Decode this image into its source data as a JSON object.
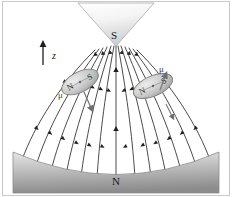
{
  "figure": {
    "name": "magnetic-dipoles-in-inhomogeneous-field",
    "width": 232,
    "height": 197,
    "background": "#ffffff",
    "border_color": "#b8b8b8"
  },
  "poles": {
    "top": {
      "label": "S",
      "shape": "inverted-triangle",
      "fill_light": "#fdfdfd",
      "fill_dark": "#d2d2d2",
      "apex": {
        "x": 116,
        "y": 45
      },
      "left": {
        "x": 78,
        "y": 4
      },
      "right": {
        "x": 154,
        "y": 4
      }
    },
    "bottom": {
      "label": "N",
      "shape": "concave-top-block",
      "fill_light": "#dcdcdc",
      "fill_dark": "#8e8e8e",
      "left": 13,
      "right": 219,
      "top": 152,
      "bottom": 193,
      "arc_depth": 22
    }
  },
  "axis": {
    "label": "z",
    "direction": "up",
    "x": 43,
    "y_tail": 65,
    "y_head": 41
  },
  "dipoles": [
    {
      "id": "left-dipole",
      "pole_near_top": "N",
      "pole_near_bottom": "S",
      "moment_label": "μ",
      "moment_direction": "down-right",
      "cx": 80,
      "cy": 82,
      "rx": 20,
      "ry": 10,
      "rotation_deg": -28,
      "fill_light": "#e2e2e2",
      "fill_dark": "#9f9f9f"
    },
    {
      "id": "right-dipole",
      "pole_near_top": "S",
      "pole_near_bottom": "N",
      "moment_label": "μ",
      "moment_direction": "up-right",
      "cx": 153,
      "cy": 86,
      "rx": 21,
      "ry": 10,
      "rotation_deg": -24,
      "fill_light": "#e2e2e2",
      "fill_dark": "#9f9f9f"
    }
  ],
  "field": {
    "line_color": "#2b2b2b",
    "line_width": 0.8,
    "arrow_direction": "toward-top-pole",
    "line_count": 15,
    "description": "field lines fan from the concave N pole upward converging on the S pole apex"
  },
  "labels": {
    "top_pole": "S",
    "bottom_pole": "N",
    "axis": "z",
    "dipole_left_north": "N",
    "dipole_left_south": "S",
    "dipole_left_moment": "μ",
    "dipole_right_north": "N",
    "dipole_right_south": "S",
    "dipole_right_moment": "μ"
  }
}
